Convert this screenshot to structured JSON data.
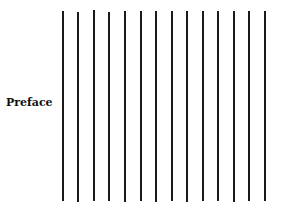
{
  "page": {
    "heading": "Preface"
  },
  "rules": {
    "count": 14,
    "color": "#1a1a1a",
    "lines": [
      {
        "x": 62,
        "top": 11,
        "bottom": 201
      },
      {
        "x": 77,
        "top": 12,
        "bottom": 202
      },
      {
        "x": 93,
        "top": 10,
        "bottom": 201
      },
      {
        "x": 108,
        "top": 12,
        "bottom": 201
      },
      {
        "x": 124,
        "top": 11,
        "bottom": 202
      },
      {
        "x": 140,
        "top": 11,
        "bottom": 201
      },
      {
        "x": 155,
        "top": 11,
        "bottom": 202
      },
      {
        "x": 171,
        "top": 11,
        "bottom": 201
      },
      {
        "x": 186,
        "top": 11,
        "bottom": 202
      },
      {
        "x": 202,
        "top": 11,
        "bottom": 201
      },
      {
        "x": 217,
        "top": 11,
        "bottom": 201
      },
      {
        "x": 233,
        "top": 11,
        "bottom": 202
      },
      {
        "x": 248,
        "top": 11,
        "bottom": 201
      },
      {
        "x": 264,
        "top": 11,
        "bottom": 201
      }
    ]
  }
}
